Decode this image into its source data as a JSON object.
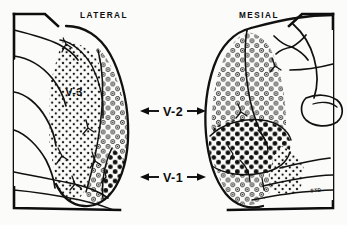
{
  "figure": {
    "background_color": "#fbfbfa",
    "ink_color": "#0d0d0d",
    "panels": [
      {
        "id": "lateral",
        "label": "LATERAL",
        "label_x": 104,
        "label_y": 18
      },
      {
        "id": "mesial",
        "label": "MESIAL",
        "label_x": 259,
        "label_y": 18
      }
    ],
    "area_labels": [
      {
        "id": "v3",
        "label": "V-3",
        "x": 74,
        "y": 96,
        "style": "inline",
        "arrows": "none",
        "texture": "fine-dots"
      },
      {
        "id": "v2",
        "label": "V-2",
        "x": 173,
        "y": 115,
        "style": "center",
        "arrows": "both",
        "texture": "open-circles"
      },
      {
        "id": "v1",
        "label": "V-1",
        "x": 173,
        "y": 180,
        "style": "center",
        "arrows": "both",
        "texture": "solid-dots"
      }
    ],
    "legend_textures": [
      {
        "area": "V-3",
        "pattern": "fine-dots",
        "description": "fine stipple dots"
      },
      {
        "area": "V-2",
        "pattern": "open-circles",
        "description": "open circles with center dot"
      },
      {
        "area": "V-1",
        "pattern": "solid-dots",
        "description": "solid filled dots"
      }
    ],
    "signature": "STD"
  }
}
